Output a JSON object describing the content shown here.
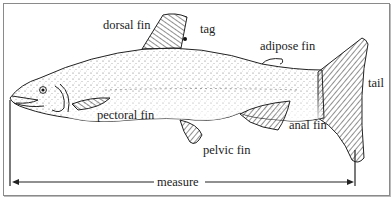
{
  "diagram": {
    "labels": {
      "dorsal_fin": "dorsal fin",
      "tag": "tag",
      "adipose_fin": "adipose fin",
      "tail": "tail",
      "pectoral_fin": "pectoral fin",
      "pelvic_fin": "pelvic fin",
      "anal_fin": "anal fin",
      "measure": "measure"
    }
  }
}
